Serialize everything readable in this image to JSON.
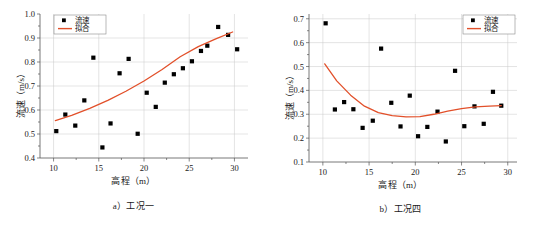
{
  "figure": {
    "panels": [
      {
        "id": "panel-a",
        "caption": "a）工况一",
        "xlabel": "高程（m）",
        "ylabel": "流速（m/s）",
        "legend": {
          "marker_label": "流速",
          "line_label": "拟合"
        },
        "colors": {
          "fit_line": "#E2502A",
          "marker": "#000000",
          "grid": "#c9c9c9",
          "axis": "#555555"
        }
      },
      {
        "id": "panel-b",
        "caption": "b）工况四",
        "xlabel": "高程（m）",
        "ylabel": "流速（m/s）",
        "legend": {
          "marker_label": "流速",
          "line_label": "拟合"
        },
        "colors": {
          "fit_line": "#E2502A",
          "marker": "#000000",
          "grid": "#c9c9c9",
          "axis": "#555555"
        }
      }
    ]
  },
  "chart_data": [
    {
      "type": "scatter",
      "title": "a）工况一",
      "xlabel": "高程（m）",
      "ylabel": "流速（m/s）",
      "xlim": [
        8.5,
        31.5
      ],
      "ylim": [
        0.4,
        1.0
      ],
      "xticks": [
        10,
        15,
        20,
        25,
        30
      ],
      "yticks": [
        0.4,
        0.5,
        0.6,
        0.7,
        0.8,
        0.9,
        1.0
      ],
      "xtick_labels": [
        "10",
        "15",
        "20",
        "25",
        "30"
      ],
      "ytick_labels": [
        "0.4",
        "0.5",
        "0.6",
        "0.7",
        "0.8",
        "0.9",
        "1.0"
      ],
      "grid": true,
      "legend_position": "top-left",
      "series": [
        {
          "name": "流速",
          "type": "scatter",
          "marker": "square",
          "color": "#000000",
          "points": [
            [
              10.3,
              0.512
            ],
            [
              11.3,
              0.581
            ],
            [
              12.4,
              0.535
            ],
            [
              13.4,
              0.64
            ],
            [
              14.4,
              0.818
            ],
            [
              15.4,
              0.444
            ],
            [
              16.3,
              0.544
            ],
            [
              17.3,
              0.753
            ],
            [
              18.3,
              0.813
            ],
            [
              19.3,
              0.501
            ],
            [
              20.3,
              0.672
            ],
            [
              21.3,
              0.613
            ],
            [
              22.3,
              0.714
            ],
            [
              23.3,
              0.749
            ],
            [
              24.3,
              0.774
            ],
            [
              25.3,
              0.803
            ],
            [
              26.3,
              0.846
            ],
            [
              27.0,
              0.868
            ],
            [
              28.2,
              0.946
            ],
            [
              29.3,
              0.913
            ],
            [
              30.3,
              0.853
            ]
          ]
        },
        {
          "name": "拟合",
          "type": "line",
          "color": "#E2502A",
          "points": [
            [
              10.2,
              0.556
            ],
            [
              12.0,
              0.578
            ],
            [
              14.0,
              0.607
            ],
            [
              16.0,
              0.64
            ],
            [
              18.0,
              0.678
            ],
            [
              20.0,
              0.721
            ],
            [
              22.0,
              0.769
            ],
            [
              24.0,
              0.822
            ],
            [
              26.0,
              0.864
            ],
            [
              28.0,
              0.897
            ],
            [
              29.8,
              0.925
            ]
          ]
        }
      ]
    },
    {
      "type": "scatter",
      "title": "b）工况四",
      "xlabel": "高程（m）",
      "ylabel": "流速（m/s）",
      "xlim": [
        8.5,
        31.0
      ],
      "ylim": [
        0.1,
        0.72
      ],
      "xticks": [
        10,
        15,
        20,
        25,
        30
      ],
      "yticks": [
        0.1,
        0.2,
        0.3,
        0.4,
        0.5,
        0.6,
        0.7
      ],
      "xtick_labels": [
        "10",
        "15",
        "20",
        "25",
        "30"
      ],
      "ytick_labels": [
        "0.1",
        "0.2",
        "0.3",
        "0.4",
        "0.5",
        "0.6",
        "0.7"
      ],
      "grid": true,
      "legend_position": "top-right",
      "series": [
        {
          "name": "流速",
          "type": "scatter",
          "marker": "square",
          "color": "#000000",
          "points": [
            [
              10.3,
              0.681
            ],
            [
              11.3,
              0.32
            ],
            [
              12.3,
              0.351
            ],
            [
              13.3,
              0.321
            ],
            [
              14.3,
              0.243
            ],
            [
              15.4,
              0.273
            ],
            [
              16.3,
              0.575
            ],
            [
              17.4,
              0.348
            ],
            [
              18.4,
              0.249
            ],
            [
              19.4,
              0.378
            ],
            [
              20.3,
              0.208
            ],
            [
              21.3,
              0.247
            ],
            [
              22.4,
              0.311
            ],
            [
              23.3,
              0.186
            ],
            [
              24.3,
              0.482
            ],
            [
              25.3,
              0.25
            ],
            [
              26.4,
              0.333
            ],
            [
              27.4,
              0.26
            ],
            [
              28.4,
              0.394
            ],
            [
              29.3,
              0.336
            ]
          ]
        },
        {
          "name": "拟合",
          "type": "line",
          "color": "#E2502A",
          "points": [
            [
              10.2,
              0.511
            ],
            [
              11.5,
              0.44
            ],
            [
              13.0,
              0.38
            ],
            [
              14.5,
              0.334
            ],
            [
              16.0,
              0.307
            ],
            [
              17.5,
              0.294
            ],
            [
              19.0,
              0.289
            ],
            [
              20.5,
              0.29
            ],
            [
              22.0,
              0.3
            ],
            [
              23.5,
              0.313
            ],
            [
              25.0,
              0.324
            ],
            [
              26.5,
              0.331
            ],
            [
              28.0,
              0.334
            ],
            [
              29.3,
              0.336
            ]
          ]
        }
      ]
    }
  ]
}
